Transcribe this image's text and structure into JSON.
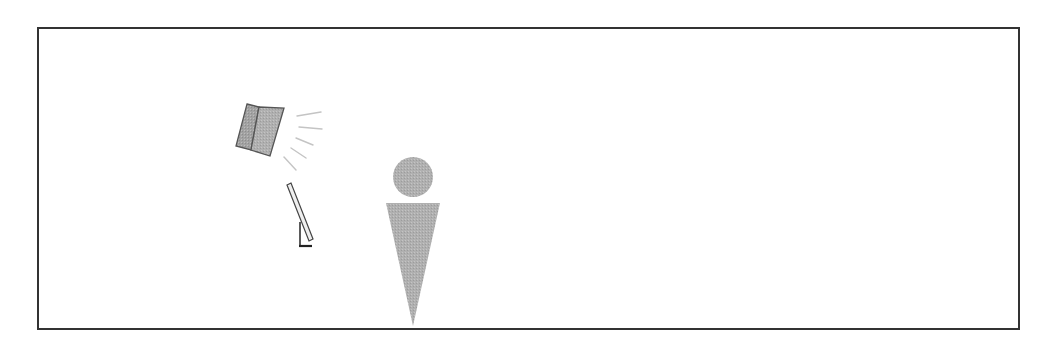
{
  "diagram": {
    "type": "scene-illustration",
    "frame": {
      "border_color": "#333333",
      "background": "#ffffff"
    },
    "elements": [
      {
        "id": "loudspeaker",
        "label": "Loudspeaker",
        "fill": "#a8a8a8",
        "stroke": "#555555"
      },
      {
        "id": "sound-waves",
        "label": "Sound waves",
        "count": 5,
        "stroke": "#c8c8c8"
      },
      {
        "id": "microphone-stand",
        "label": "Microphone on stand",
        "fill": "#eeeeee",
        "stroke": "#444444"
      },
      {
        "id": "person",
        "label": "Person",
        "fill": "#b4b4b4"
      }
    ]
  }
}
